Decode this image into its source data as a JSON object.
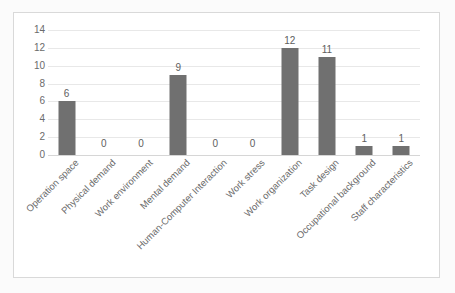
{
  "chart_data": {
    "type": "bar",
    "title": "",
    "subtitle": "",
    "xlabel": "",
    "ylabel": "",
    "categories": [
      "Operation space",
      "Physical demand",
      "Work environment",
      "Mental demand",
      "Human-Computer Interaction",
      "Work stress",
      "Work organization",
      "Task design",
      "Occupational background",
      "Staff characteristics"
    ],
    "values": [
      6,
      0,
      0,
      9,
      0,
      0,
      12,
      11,
      1,
      1
    ],
    "data_labels": [
      "6",
      "0",
      "0",
      "9",
      "0",
      "0",
      "12",
      "11",
      "1",
      "1"
    ],
    "ylim": [
      0,
      14
    ],
    "ytick_values": [
      0,
      2,
      4,
      6,
      8,
      10,
      12,
      14
    ],
    "ytick_labels": [
      "0",
      "2",
      "4",
      "6",
      "8",
      "10",
      "12",
      "14"
    ],
    "grid": true,
    "grid_axis": "y",
    "legend": false,
    "legend_position": "none",
    "series_name": "",
    "bar_color": "#707070",
    "gridline_color": "#e8e8e8",
    "axis_label_color": "#6b6b6b",
    "plot_background": "#ffffff",
    "frame_border_color": "#d9d9d9"
  }
}
